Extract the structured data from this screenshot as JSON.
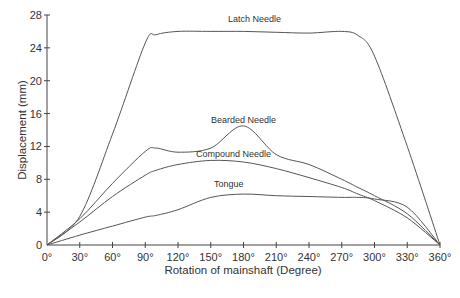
{
  "chart_data": {
    "type": "line",
    "title": "",
    "xlabel": "Rotation of mainshaft (Degree)",
    "ylabel": "Displacement (mm)",
    "xlim": [
      0,
      360
    ],
    "ylim": [
      0,
      28
    ],
    "grid": false,
    "legend": "inline labels on curves",
    "x_ticks": [
      "0°",
      "30°",
      "60°",
      "90°",
      "120°",
      "150°",
      "180°",
      "210°",
      "240°",
      "270°",
      "300°",
      "330°",
      "360°"
    ],
    "y_ticks": [
      "0",
      "4",
      "8",
      "12",
      "16",
      "20",
      "24",
      "28"
    ],
    "x": [
      0,
      30,
      60,
      90,
      100,
      120,
      150,
      180,
      210,
      240,
      270,
      285,
      300,
      330,
      360
    ],
    "series": [
      {
        "name": "Latch Needle",
        "values": [
          0,
          3.5,
          13.5,
          24.6,
          25.6,
          26.0,
          26.0,
          26.0,
          25.9,
          25.8,
          26.0,
          25.5,
          23.0,
          12.0,
          0
        ]
      },
      {
        "name": "Bearded Needle",
        "values": [
          0,
          3.2,
          7.5,
          11.4,
          11.8,
          11.3,
          11.8,
          14.5,
          11.0,
          9.8,
          8.0,
          7.0,
          6.0,
          3.8,
          0
        ]
      },
      {
        "name": "Compound Needle",
        "values": [
          0,
          2.8,
          5.9,
          8.5,
          9.1,
          9.8,
          10.3,
          10.1,
          9.3,
          8.2,
          7.0,
          6.2,
          5.4,
          3.3,
          0
        ]
      },
      {
        "name": "Tongue",
        "values": [
          0,
          1.2,
          2.3,
          3.4,
          3.6,
          4.3,
          5.8,
          6.2,
          6.0,
          5.9,
          5.8,
          5.8,
          5.6,
          4.6,
          0
        ]
      }
    ]
  },
  "labels": {
    "latch": "Latch Needle",
    "bearded": "Bearded Needle",
    "compound": "Compound Needle",
    "tongue": "Tongue"
  }
}
